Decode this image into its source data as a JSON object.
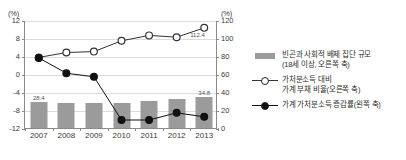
{
  "chart_data": {
    "type": "bar",
    "title": "",
    "categories": [
      "2007",
      "2008",
      "2009",
      "2010",
      "2011",
      "2012",
      "2013"
    ],
    "xlabel": "",
    "axes": {
      "left": {
        "unit_label": "(%)",
        "ticks": [
          "12",
          "8",
          "4",
          "0",
          "-4",
          "-8",
          "-12"
        ],
        "ylim": [
          -12,
          12
        ],
        "ylabel": "(%)"
      },
      "right": {
        "unit_label": "(%)",
        "ticks": [
          "120",
          "100",
          "80",
          "60",
          "40",
          "20",
          "0"
        ],
        "ylim": [
          0,
          120
        ],
        "ylabel": "(%)"
      }
    },
    "grid": true,
    "legend_position": "right",
    "series": [
      {
        "name": "빈곤과 사회적 배제 집단 규모",
        "name_line2": "(18세 이상, 오른쪽 축)",
        "type": "bar",
        "axis": "right",
        "color": "#9b9b9b",
        "values": [
          28.4,
          27.5,
          27.3,
          27.3,
          29.5,
          32.5,
          34.8
        ],
        "point_labels": [
          "28.4",
          "",
          "",
          "",
          "",
          "",
          "34.8"
        ]
      },
      {
        "name": "가처분소득 대비",
        "name_line2": "가계 부채 비율(오른쪽 축)",
        "type": "line",
        "axis": "right",
        "marker": "open-circle",
        "color": "#333333",
        "values": [
          79.5,
          85.0,
          86.0,
          98.0,
          104.0,
          102.0,
          112.4
        ],
        "point_labels": [
          "",
          "",
          "",
          "",
          "",
          "",
          "112.4"
        ]
      },
      {
        "name": "가계 가처분소득 증감률(왼쪽 축)",
        "name_line2": "",
        "type": "line",
        "axis": "left",
        "marker": "filled-circle",
        "color": "#111111",
        "values": [
          3.8,
          0.4,
          -0.4,
          -10.0,
          -10.0,
          -8.4,
          -9.3
        ],
        "point_labels": [
          "",
          "",
          "",
          "",
          "",
          "",
          ""
        ]
      }
    ]
  },
  "legend": {
    "items": [
      {
        "marker": "bar-swatch",
        "line1": "빈곤과 사회적 배제 집단 규모",
        "line2": "(18세 이상, 오른쪽 축)"
      },
      {
        "marker": "open-circle-line",
        "line1": "가처분소득 대비",
        "line2": "가계 부채 비율(오른쪽 축)"
      },
      {
        "marker": "filled-circle-line",
        "line1": "가계 가처분소득 증감률(왼쪽 축)",
        "line2": ""
      }
    ]
  },
  "colors": {
    "bar": "#9b9b9b",
    "line_open": "#333333",
    "line_filled": "#111111",
    "grid": "#dcdcdc",
    "axis": "#8a8a8a"
  }
}
